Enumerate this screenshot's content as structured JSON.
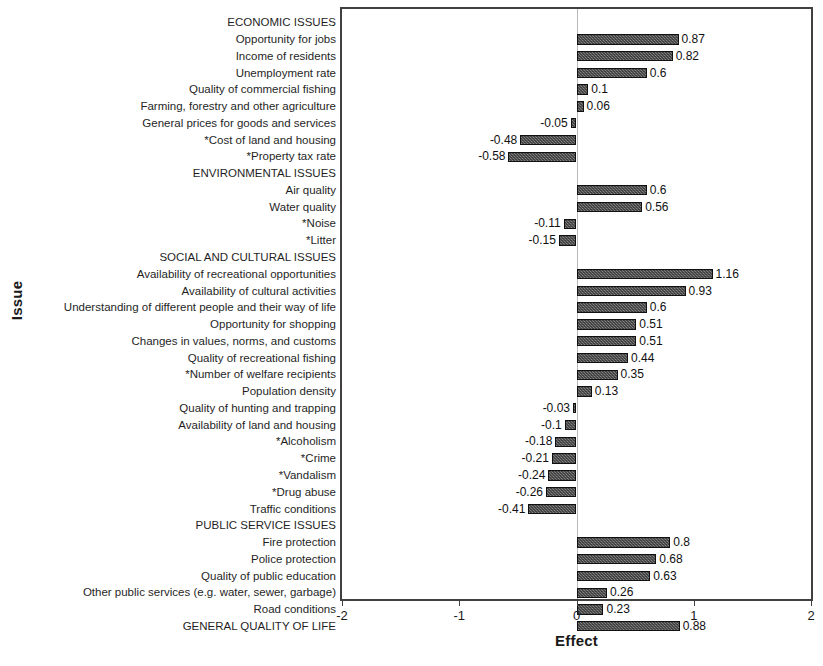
{
  "chart_data": {
    "type": "bar",
    "orientation": "horizontal",
    "title": "",
    "xlabel": "Effect",
    "ylabel": "Issue",
    "xlim": [
      -2,
      2
    ],
    "xticks": [
      -2,
      -1,
      0,
      1,
      2
    ],
    "xtick_labels": [
      "-2",
      "-1",
      "0",
      "1",
      "2"
    ],
    "grid": false,
    "legend": null,
    "zero_reference_line": 0,
    "bar_color": "#6e6e6e",
    "bar_edge_color": "#111111",
    "frame_color": "#404040",
    "categories": [
      "ECONOMIC ISSUES",
      "Opportunity for jobs",
      "Income of residents",
      "Unemployment rate",
      "Quality of commercial fishing",
      "Farming, forestry and other agriculture",
      "General prices for goods and services",
      "*Cost of land and housing",
      "*Property tax rate",
      "ENVIRONMENTAL ISSUES",
      "Air quality",
      "Water quality",
      "*Noise",
      "*Litter",
      "SOCIAL AND CULTURAL ISSUES",
      "Availability of recreational opportunities",
      "Availability of cultural activities",
      "Understanding of different people and their way of life",
      "Opportunity for shopping",
      "Changes in values, norms, and customs",
      "Quality of recreational fishing",
      "*Number of welfare recipients",
      "Population density",
      "Quality of hunting and trapping",
      "Availability of land and housing",
      "*Alcoholism",
      "*Crime",
      "*Vandalism",
      "*Drug abuse",
      "Traffic conditions",
      "PUBLIC SERVICE ISSUES",
      "Fire protection",
      "Police protection",
      "Quality of public education",
      "Other public services (e.g. water, sewer, garbage)",
      "Road conditions",
      "GENERAL QUALITY OF LIFE"
    ],
    "values": [
      null,
      0.87,
      0.82,
      0.6,
      0.1,
      0.06,
      -0.05,
      -0.48,
      -0.58,
      null,
      0.6,
      0.56,
      -0.11,
      -0.15,
      null,
      1.16,
      0.93,
      0.6,
      0.51,
      0.51,
      0.44,
      0.35,
      0.13,
      -0.03,
      -0.1,
      -0.18,
      -0.21,
      -0.24,
      -0.26,
      -0.41,
      null,
      0.8,
      0.68,
      0.63,
      0.26,
      0.23,
      0.88
    ],
    "value_labels": [
      "",
      "0.87",
      "0.82",
      "0.6",
      "0.1",
      "0.06",
      "-0.05",
      "-0.48",
      "-0.58",
      "",
      "0.6",
      "0.56",
      "-0.11",
      "-0.15",
      "",
      "1.16",
      "0.93",
      "0.6",
      "0.51",
      "0.51",
      "0.44",
      "0.35",
      "0.13",
      "-0.03",
      "-0.1",
      "-0.18",
      "-0.21",
      "-0.24",
      "-0.26",
      "-0.41",
      "",
      "0.8",
      "0.68",
      "0.63",
      "0.26",
      "0.23",
      "0.88"
    ],
    "section_headers": [
      "ECONOMIC ISSUES",
      "ENVIRONMENTAL ISSUES",
      "SOCIAL AND CULTURAL ISSUES",
      "PUBLIC SERVICE ISSUES",
      "GENERAL QUALITY OF LIFE"
    ]
  }
}
